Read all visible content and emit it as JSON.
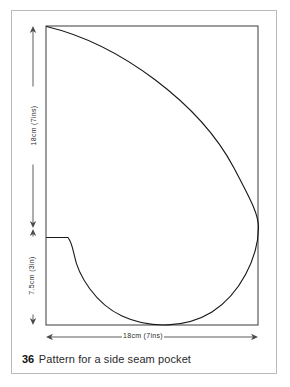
{
  "figure": {
    "caption_number": "36",
    "caption_text": "Pattern for a side seam pocket",
    "dimensions": {
      "height_main": "18cm (7ins)",
      "height_lower": "7.5cm (3in)",
      "width_bottom": "18cm (7ins)"
    },
    "colors": {
      "page_background": "#ffffff",
      "page_frame": "#b9b9b9",
      "pattern_outline": "#1a1a1a",
      "bounding_box": "#3a3a3a",
      "dimension_line": "#4a4a4a",
      "caption": "#111111"
    },
    "geometry": {
      "bounding_box": {
        "left": 46,
        "top": 26,
        "right": 258,
        "bottom": 325
      },
      "notch_y": 237,
      "notch_x_end": 68,
      "curve_right_extreme_y": 228,
      "curve_bottom_y": 323
    }
  }
}
